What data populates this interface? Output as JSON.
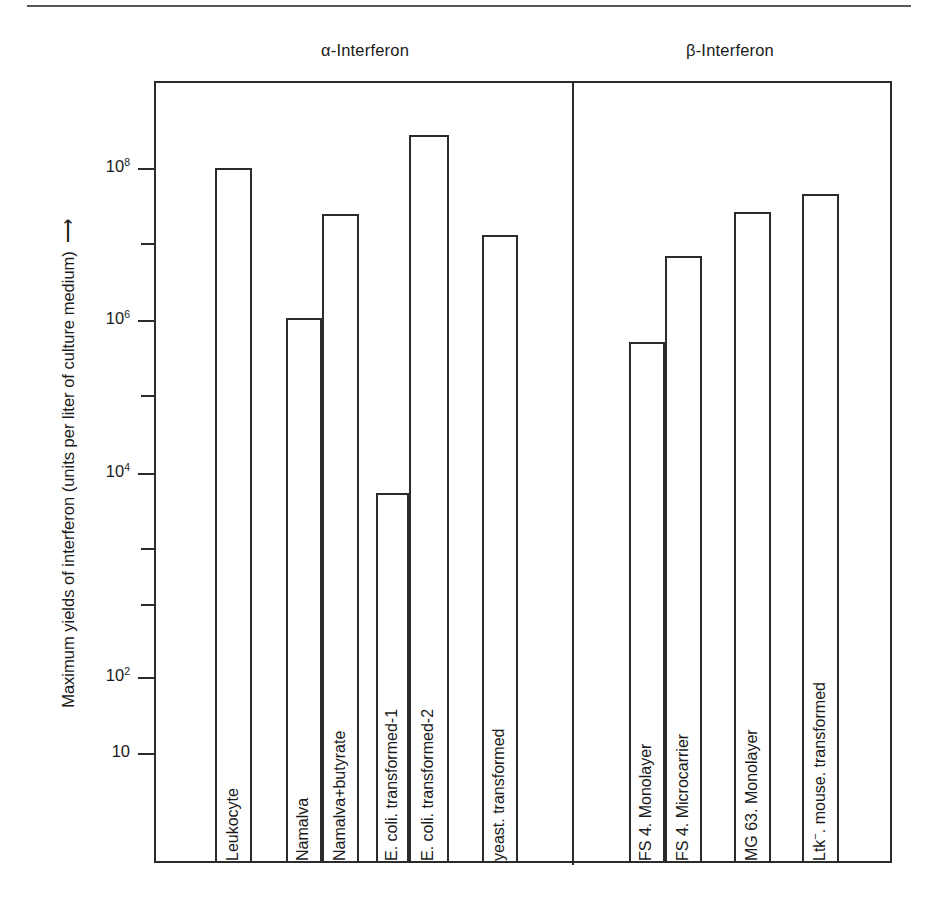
{
  "chart_data": {
    "type": "bar",
    "title": "",
    "xlabel": "",
    "ylabel": "Maximum yields of interferon (units per liter of culture medium)",
    "y_scale": "log",
    "y_tick_labels": [
      "10",
      "10^2",
      "10^4",
      "10^6",
      "10^8"
    ],
    "ylim": [
      1,
      1000000000
    ],
    "grid": false,
    "legend": "none",
    "groups": [
      {
        "name": "alpha-Interferon",
        "label": "α-Interferon",
        "categories": [
          "Leukocyte",
          "Namalva",
          "Namalva+butyrate",
          "E. coli. transformed-1",
          "E. coli. transformed-2",
          "yeast. transformed"
        ],
        "values": [
          100000000,
          2000000,
          30000000,
          22000,
          250000000,
          17000000
        ]
      },
      {
        "name": "beta-Interferon",
        "label": "β-Interferon",
        "categories": [
          "FS 4. Monolayer",
          "FS 4. Microcarrier",
          "MG 63. Monolayer",
          "Ltk⁻. mouse. transformed"
        ],
        "values": [
          1100000,
          10000000,
          30000000,
          50000000
        ]
      }
    ]
  },
  "axis": {
    "title_text": "Maximum yields of interferon (units per liter of culture medium)",
    "arrow_glyph": "⟶",
    "ticks": [
      {
        "label_base": "10",
        "label_exp": "8",
        "top": 168,
        "major": true
      },
      {
        "label_base": "",
        "label_exp": "",
        "top": 243,
        "major": false
      },
      {
        "label_base": "10",
        "label_exp": "6",
        "top": 320,
        "major": true
      },
      {
        "label_base": "",
        "label_exp": "",
        "top": 395,
        "major": false
      },
      {
        "label_base": "10",
        "label_exp": "4",
        "top": 473,
        "major": true
      },
      {
        "label_base": "",
        "label_exp": "",
        "top": 548,
        "major": false
      },
      {
        "label_base": "",
        "label_exp": "",
        "top": 604,
        "major": false
      },
      {
        "label_base": "10",
        "label_exp": "2",
        "top": 677,
        "major": true
      },
      {
        "label_base": "10",
        "label_exp": "",
        "top": 753,
        "major": true
      }
    ]
  },
  "headers": [
    {
      "label": "α-Interferon",
      "left": 200,
      "width": 330
    },
    {
      "label": "β-Interferon",
      "left": 600,
      "width": 260
    }
  ],
  "bars": [
    {
      "name": "leukocyte",
      "label": "Leukocyte",
      "label_sup": "",
      "left": 215,
      "width": 37,
      "top": 168,
      "label_bottom": 845
    },
    {
      "name": "namalva",
      "label": "Namalva",
      "label_sup": "",
      "left": 286,
      "width": 36,
      "top": 318,
      "label_bottom": 845
    },
    {
      "name": "namalva-butyrate",
      "label": "Namalva+butyrate",
      "label_sup": "",
      "left": 322,
      "width": 37,
      "top": 214,
      "label_bottom": 845
    },
    {
      "name": "ecoli-transformed-1",
      "label": "E. coli. transformed-1",
      "label_sup": "",
      "left": 376,
      "width": 33,
      "top": 493,
      "label_bottom": 845
    },
    {
      "name": "ecoli-transformed-2",
      "label": "E. coli. transformed-2",
      "label_sup": "",
      "left": 409,
      "width": 40,
      "top": 135,
      "label_bottom": 845
    },
    {
      "name": "yeast-transformed",
      "label": "yeast. transformed",
      "label_sup": "",
      "left": 482,
      "width": 36,
      "top": 235,
      "label_bottom": 845
    },
    {
      "name": "fs4-monolayer",
      "label": "FS 4. Monolayer",
      "label_sup": "",
      "left": 629,
      "width": 36,
      "top": 342,
      "label_bottom": 845
    },
    {
      "name": "fs4-microcarrier",
      "label": "FS 4. Microcarrier",
      "label_sup": "",
      "left": 665,
      "width": 37,
      "top": 256,
      "label_bottom": 845
    },
    {
      "name": "mg63-monolayer",
      "label": "MG 63. Monolayer",
      "label_sup": "",
      "left": 734,
      "width": 37,
      "top": 212,
      "label_bottom": 845
    },
    {
      "name": "ltk-mouse-transformed",
      "label": "Ltk",
      "label_sup": "−",
      "label_tail": ". mouse. transformed",
      "left": 802,
      "width": 37,
      "top": 194,
      "label_bottom": 845
    }
  ],
  "layout": {
    "frame": {
      "left": 154,
      "top": 81,
      "width": 738,
      "height": 782
    },
    "divider_left": 572,
    "baseline_top": 861
  },
  "colors": {
    "ink": "#2b2b2b",
    "rule": "#58585a",
    "background": "#ffffff"
  }
}
